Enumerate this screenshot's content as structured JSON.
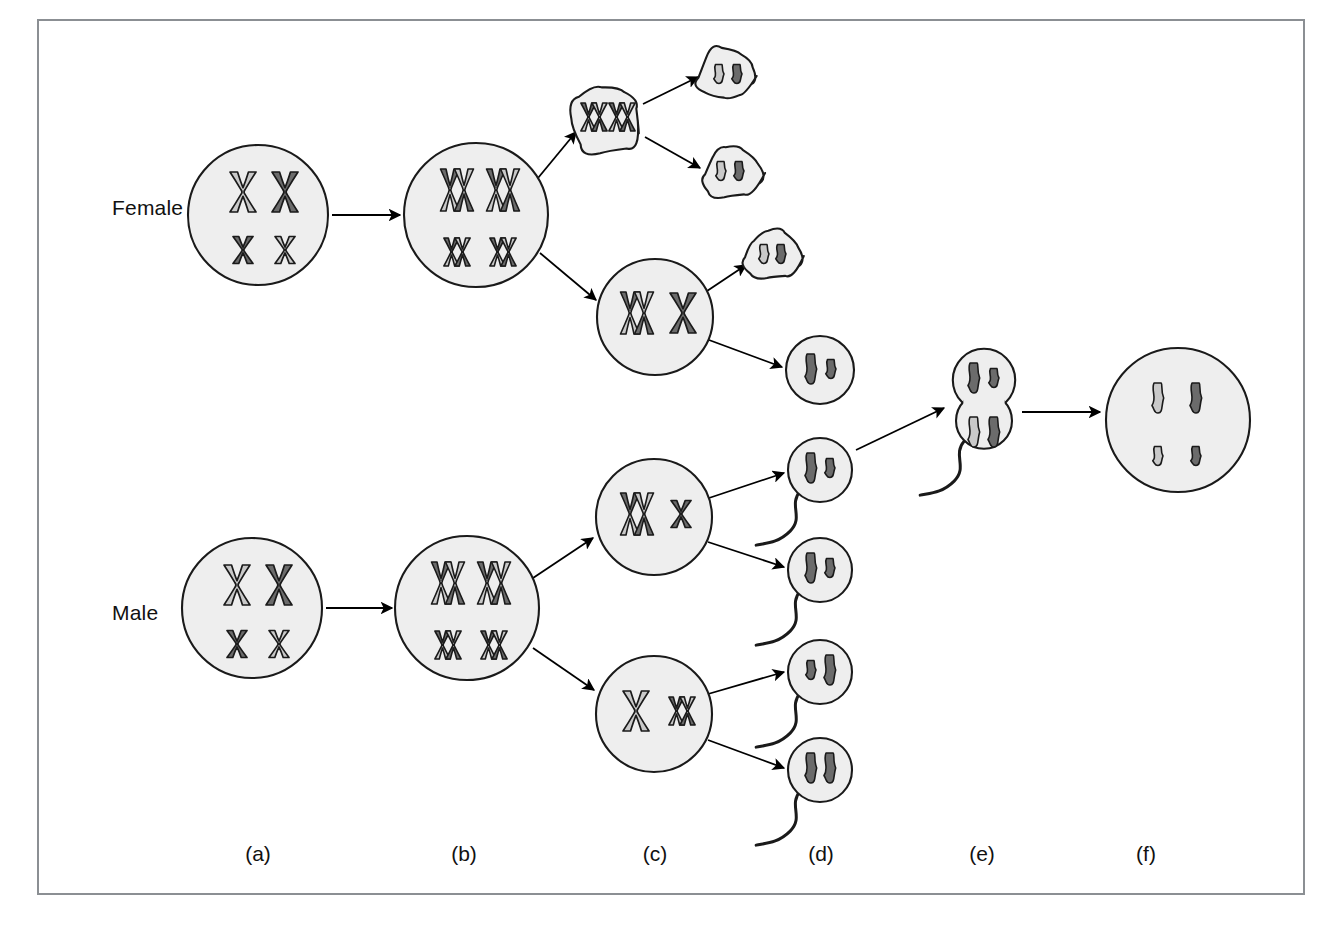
{
  "figure": {
    "border_color": "#8b8f93",
    "background": "#ffffff"
  },
  "palette": {
    "cell_fill": "#eeeeee",
    "cell_stroke": "#1a1a1a",
    "chromatid_light": "#c9c9c9",
    "chromatid_dark": "#6b6b6b",
    "chromatid_outline": "#1a1a1a",
    "arrow_color": "#000000",
    "text_color": "#111111"
  },
  "row_labels": [
    {
      "key": "female",
      "label": "Female",
      "x": 112,
      "y": 210
    },
    {
      "key": "male",
      "label": "Male",
      "x": 112,
      "y": 615
    }
  ],
  "column_labels": [
    {
      "key": "a",
      "label": "(a)",
      "x": 258,
      "y": 856
    },
    {
      "key": "b",
      "label": "(b)",
      "x": 464,
      "y": 856
    },
    {
      "key": "c",
      "label": "(c)",
      "x": 655,
      "y": 856
    },
    {
      "key": "d",
      "label": "(d)",
      "x": 821,
      "y": 856
    },
    {
      "key": "e",
      "label": "(e)",
      "x": 982,
      "y": 856
    },
    {
      "key": "f",
      "label": "(f)",
      "x": 1146,
      "y": 856
    }
  ],
  "stages": {
    "a": "diploid germ cell",
    "b": "chromosome duplication",
    "c": "first meiotic division",
    "d": "second meiotic division / mature gametes",
    "e": "fertilization",
    "f": "zygote"
  },
  "cells": [
    {
      "name": "female-primary-oocyte",
      "stage": "a",
      "shape": "circle",
      "cx": 258,
      "cy": 215,
      "r": 70,
      "chromosomes": [
        {
          "form": "duplicated-x",
          "size": "large",
          "shade": "light",
          "x": 243,
          "y": 192
        },
        {
          "form": "duplicated-x",
          "size": "large",
          "shade": "dark",
          "x": 285,
          "y": 192
        },
        {
          "form": "duplicated-x",
          "size": "small",
          "shade": "dark",
          "x": 243,
          "y": 250
        },
        {
          "form": "duplicated-x",
          "size": "small",
          "shade": "light",
          "x": 285,
          "y": 250
        }
      ]
    },
    {
      "name": "female-duplicated-primary-oocyte",
      "stage": "b",
      "shape": "circle",
      "cx": 476,
      "cy": 215,
      "r": 72,
      "chromosomes": [
        {
          "form": "duplicated-x-pair",
          "size": "large",
          "shade": "mixed",
          "x": 457,
          "y": 190
        },
        {
          "form": "duplicated-x-pair",
          "size": "large",
          "shade": "mixed",
          "x": 503,
          "y": 190
        },
        {
          "form": "duplicated-x-pair",
          "size": "small",
          "shade": "mixed",
          "x": 457,
          "y": 252
        },
        {
          "form": "duplicated-x-pair",
          "size": "small",
          "shade": "mixed",
          "x": 503,
          "y": 252
        }
      ]
    },
    {
      "name": "first-polar-body",
      "stage": "c",
      "shape": "blob",
      "cx": 608,
      "cy": 120,
      "r": 40,
      "chromosomes": [
        {
          "form": "duplicated-x-pair",
          "size": "small",
          "shade": "mixed",
          "x": 594,
          "y": 117
        },
        {
          "form": "duplicated-x-pair",
          "size": "small",
          "shade": "mixed",
          "x": 622,
          "y": 117
        }
      ]
    },
    {
      "name": "polar-body-daughter-top",
      "stage": "d",
      "shape": "blob",
      "cx": 728,
      "cy": 76,
      "r": 30,
      "chromosomes": [
        {
          "form": "single",
          "size": "small",
          "shade": "light",
          "x": 719,
          "y": 74
        },
        {
          "form": "single",
          "size": "small",
          "shade": "dark",
          "x": 737,
          "y": 74
        }
      ]
    },
    {
      "name": "polar-body-daughter-bottom",
      "stage": "d",
      "shape": "blob",
      "cx": 730,
      "cy": 173,
      "r": 30,
      "chromosomes": [
        {
          "form": "single",
          "size": "small",
          "shade": "light",
          "x": 721,
          "y": 171
        },
        {
          "form": "single",
          "size": "small",
          "shade": "dark",
          "x": 739,
          "y": 171
        }
      ]
    },
    {
      "name": "secondary-oocyte",
      "stage": "c",
      "shape": "circle",
      "cx": 655,
      "cy": 317,
      "r": 58,
      "chromosomes": [
        {
          "form": "duplicated-x-pair",
          "size": "large",
          "shade": "mixed",
          "x": 637,
          "y": 313
        },
        {
          "form": "duplicated-x",
          "size": "large",
          "shade": "dark",
          "x": 683,
          "y": 313
        }
      ]
    },
    {
      "name": "second-polar-body",
      "stage": "d",
      "shape": "blob",
      "cx": 772,
      "cy": 256,
      "r": 28,
      "chromosomes": [
        {
          "form": "single",
          "size": "small",
          "shade": "light",
          "x": 764,
          "y": 254
        },
        {
          "form": "single",
          "size": "small",
          "shade": "dark",
          "x": 781,
          "y": 254
        }
      ]
    },
    {
      "name": "ovum",
      "stage": "d",
      "shape": "circle",
      "cx": 820,
      "cy": 370,
      "r": 34,
      "chromosomes": [
        {
          "form": "single",
          "size": "large",
          "shade": "dark",
          "x": 811,
          "y": 369
        },
        {
          "form": "single",
          "size": "small",
          "shade": "dark",
          "x": 831,
          "y": 369
        }
      ]
    },
    {
      "name": "male-primary-spermatocyte",
      "stage": "a",
      "shape": "circle",
      "cx": 252,
      "cy": 608,
      "r": 70,
      "chromosomes": [
        {
          "form": "duplicated-x",
          "size": "large",
          "shade": "light",
          "x": 237,
          "y": 585
        },
        {
          "form": "duplicated-x",
          "size": "large",
          "shade": "dark",
          "x": 279,
          "y": 585
        },
        {
          "form": "duplicated-x",
          "size": "small",
          "shade": "dark",
          "x": 237,
          "y": 644
        },
        {
          "form": "duplicated-x",
          "size": "small",
          "shade": "light",
          "x": 279,
          "y": 644
        }
      ]
    },
    {
      "name": "male-duplicated-primary-spermatocyte",
      "stage": "b",
      "shape": "circle",
      "cx": 467,
      "cy": 608,
      "r": 72,
      "chromosomes": [
        {
          "form": "duplicated-x-pair",
          "size": "large",
          "shade": "mixed",
          "x": 448,
          "y": 583
        },
        {
          "form": "duplicated-x-pair",
          "size": "large",
          "shade": "mixed",
          "x": 494,
          "y": 583
        },
        {
          "form": "duplicated-x-pair",
          "size": "small",
          "shade": "mixed",
          "x": 448,
          "y": 645
        },
        {
          "form": "duplicated-x-pair",
          "size": "small",
          "shade": "mixed",
          "x": 494,
          "y": 645
        }
      ]
    },
    {
      "name": "secondary-spermatocyte-top",
      "stage": "c",
      "shape": "circle",
      "cx": 654,
      "cy": 517,
      "r": 58,
      "chromosomes": [
        {
          "form": "duplicated-x-pair",
          "size": "large",
          "shade": "mixed",
          "x": 637,
          "y": 514
        },
        {
          "form": "duplicated-x",
          "size": "small",
          "shade": "dark",
          "x": 681,
          "y": 514
        }
      ]
    },
    {
      "name": "secondary-spermatocyte-bottom",
      "stage": "c",
      "shape": "circle",
      "cx": 654,
      "cy": 714,
      "r": 58,
      "chromosomes": [
        {
          "form": "duplicated-x",
          "size": "large",
          "shade": "light",
          "x": 636,
          "y": 711
        },
        {
          "form": "duplicated-x-pair",
          "size": "small",
          "shade": "mixed",
          "x": 682,
          "y": 711
        }
      ]
    },
    {
      "name": "sperm-1",
      "stage": "d",
      "shape": "sperm",
      "cx": 820,
      "cy": 470,
      "r": 32,
      "chromosomes": [
        {
          "form": "single",
          "size": "large",
          "shade": "dark",
          "x": 811,
          "y": 468
        },
        {
          "form": "single",
          "size": "small",
          "shade": "dark",
          "x": 830,
          "y": 468
        }
      ]
    },
    {
      "name": "sperm-2",
      "stage": "d",
      "shape": "sperm",
      "cx": 820,
      "cy": 570,
      "r": 32,
      "chromosomes": [
        {
          "form": "single",
          "size": "large",
          "shade": "dark",
          "x": 811,
          "y": 568
        },
        {
          "form": "single",
          "size": "small",
          "shade": "dark",
          "x": 830,
          "y": 568
        }
      ]
    },
    {
      "name": "sperm-3",
      "stage": "d",
      "shape": "sperm",
      "cx": 820,
      "cy": 672,
      "r": 32,
      "chromosomes": [
        {
          "form": "single",
          "size": "small",
          "shade": "dark",
          "x": 811,
          "y": 670
        },
        {
          "form": "single",
          "size": "large",
          "shade": "dark",
          "x": 830,
          "y": 670
        }
      ]
    },
    {
      "name": "sperm-4",
      "stage": "d",
      "shape": "sperm",
      "cx": 820,
      "cy": 770,
      "r": 32,
      "chromosomes": [
        {
          "form": "single",
          "size": "large",
          "shade": "dark",
          "x": 811,
          "y": 768
        },
        {
          "form": "single",
          "size": "large",
          "shade": "dark",
          "x": 830,
          "y": 768
        }
      ]
    },
    {
      "name": "fertilized-egg",
      "stage": "e",
      "shape": "fusion",
      "cx": 984,
      "cy": 400,
      "r": 40,
      "chromosomes": [
        {
          "form": "single",
          "size": "large",
          "shade": "dark",
          "x": 974,
          "y": 378
        },
        {
          "form": "single",
          "size": "small",
          "shade": "dark",
          "x": 994,
          "y": 378
        },
        {
          "form": "single",
          "size": "large",
          "shade": "light",
          "x": 974,
          "y": 432
        },
        {
          "form": "single",
          "size": "large",
          "shade": "dark",
          "x": 994,
          "y": 432
        }
      ]
    },
    {
      "name": "zygote",
      "stage": "f",
      "shape": "circle",
      "cx": 1178,
      "cy": 420,
      "r": 72,
      "chromosomes": [
        {
          "form": "single",
          "size": "large",
          "shade": "light",
          "x": 1158,
          "y": 398
        },
        {
          "form": "single",
          "size": "large",
          "shade": "dark",
          "x": 1196,
          "y": 398
        },
        {
          "form": "single",
          "size": "small",
          "shade": "light",
          "x": 1158,
          "y": 456
        },
        {
          "form": "single",
          "size": "small",
          "shade": "dark",
          "x": 1196,
          "y": 456
        }
      ]
    }
  ],
  "arrows": [
    {
      "name": "arrow-female-a-to-b",
      "x1": 332,
      "y1": 215,
      "x2": 400,
      "y2": 215
    },
    {
      "name": "arrow-female-b-to-polar-body",
      "x1": 538,
      "y1": 178,
      "x2": 576,
      "y2": 132
    },
    {
      "name": "arrow-female-b-to-secondary-oocyte",
      "x1": 540,
      "y1": 253,
      "x2": 596,
      "y2": 300
    },
    {
      "name": "arrow-polar-body-to-daughter-top",
      "x1": 643,
      "y1": 104,
      "x2": 698,
      "y2": 77
    },
    {
      "name": "arrow-polar-body-to-daughter-bottom",
      "x1": 645,
      "y1": 137,
      "x2": 700,
      "y2": 168
    },
    {
      "name": "arrow-secondary-oocyte-to-second-polar-body",
      "x1": 707,
      "y1": 291,
      "x2": 746,
      "y2": 265
    },
    {
      "name": "arrow-secondary-oocyte-to-ovum",
      "x1": 709,
      "y1": 340,
      "x2": 782,
      "y2": 367
    },
    {
      "name": "arrow-male-a-to-b",
      "x1": 326,
      "y1": 608,
      "x2": 392,
      "y2": 608
    },
    {
      "name": "arrow-male-b-to-secondary-top",
      "x1": 533,
      "y1": 578,
      "x2": 593,
      "y2": 538
    },
    {
      "name": "arrow-male-b-to-secondary-bottom",
      "x1": 533,
      "y1": 648,
      "x2": 594,
      "y2": 690
    },
    {
      "name": "arrow-secondary-top-to-sperm-1",
      "x1": 709,
      "y1": 498,
      "x2": 784,
      "y2": 473
    },
    {
      "name": "arrow-secondary-top-to-sperm-2",
      "x1": 708,
      "y1": 542,
      "x2": 784,
      "y2": 567
    },
    {
      "name": "arrow-secondary-bottom-to-sperm-3",
      "x1": 708,
      "y1": 694,
      "x2": 784,
      "y2": 672
    },
    {
      "name": "arrow-secondary-bottom-to-sperm-4",
      "x1": 708,
      "y1": 740,
      "x2": 784,
      "y2": 768
    },
    {
      "name": "arrow-ovum-to-fertilization",
      "x1": 856,
      "y1": 450,
      "x2": 944,
      "y2": 408
    },
    {
      "name": "arrow-fertilization-to-zygote",
      "x1": 1022,
      "y1": 412,
      "x2": 1100,
      "y2": 412
    }
  ]
}
